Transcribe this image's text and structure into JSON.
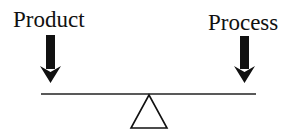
{
  "diagram": {
    "type": "balance-scale",
    "left_label": "Product",
    "right_label": "Process",
    "colors": {
      "ink": "#111111",
      "background": "#ffffff"
    }
  }
}
